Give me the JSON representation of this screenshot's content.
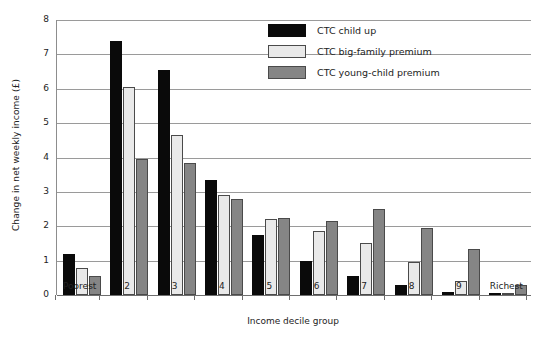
{
  "chart_data": {
    "type": "bar",
    "title": "",
    "xlabel": "Income decile group",
    "ylabel": "Change in net weekly income (£)",
    "categories": [
      "Poorest",
      "2",
      "3",
      "4",
      "5",
      "6",
      "7",
      "8",
      "9",
      "Richest"
    ],
    "ylim": [
      0,
      8
    ],
    "yticks": [
      0,
      1,
      2,
      3,
      4,
      5,
      6,
      7,
      8
    ],
    "ytick_labels": [
      "0",
      "1",
      "2",
      "3",
      "4",
      "5",
      "6",
      "7",
      "8"
    ],
    "grid": true,
    "legend_position": "top-right",
    "series": [
      {
        "name": "CTC child up",
        "color": "#0a0a0a",
        "values": [
          1.2,
          7.4,
          6.55,
          3.35,
          1.75,
          1.0,
          0.55,
          0.3,
          0.1,
          0.0
        ]
      },
      {
        "name": "CTC big-family premium",
        "color": "#e9e9e9",
        "values": [
          0.8,
          6.05,
          4.65,
          2.9,
          2.2,
          1.85,
          1.5,
          0.95,
          0.4,
          0.05
        ]
      },
      {
        "name": "CTC young-child premium",
        "color": "#858585",
        "values": [
          0.55,
          3.95,
          3.85,
          2.8,
          2.25,
          2.15,
          2.5,
          1.95,
          1.35,
          0.3
        ]
      }
    ]
  },
  "legend": {
    "items": [
      {
        "label": "CTC child up",
        "swatch": "black"
      },
      {
        "label": "CTC big-family premium",
        "swatch": "light-gray"
      },
      {
        "label": "CTC young-child premium",
        "swatch": "medium-gray"
      }
    ]
  }
}
